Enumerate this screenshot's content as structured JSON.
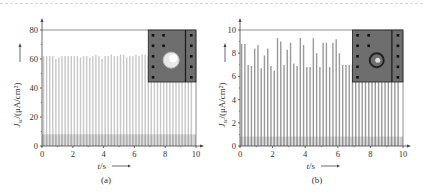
{
  "chart_data": [
    {
      "type": "bar",
      "panel_label": "(a)",
      "title": "",
      "xlabel": "t/s",
      "ylabel": "J_sc/(μA/cm²)",
      "xlim": [
        0,
        10
      ],
      "ylim": [
        0,
        80
      ],
      "xticks": [
        0,
        2,
        4,
        6,
        8,
        10
      ],
      "yticks": [
        0,
        20,
        40,
        60,
        80
      ],
      "grid": false,
      "baseline_level": 8,
      "x": [
        0.1,
        0.3,
        0.5,
        0.7,
        0.9,
        1.1,
        1.3,
        1.5,
        1.7,
        1.9,
        2.1,
        2.3,
        2.5,
        2.7,
        2.9,
        3.1,
        3.3,
        3.5,
        3.7,
        3.9,
        4.1,
        4.3,
        4.5,
        4.7,
        4.9,
        5.1,
        5.3,
        5.5,
        5.7,
        5.9,
        6.1,
        6.3,
        6.5,
        6.7,
        6.9,
        7.1,
        7.3,
        7.5,
        7.7,
        7.9,
        8.1,
        8.3,
        8.5,
        8.7,
        8.9,
        9.1,
        9.3,
        9.5,
        9.7
      ],
      "values": [
        62,
        62,
        62,
        62,
        60,
        61,
        62,
        62,
        62,
        62,
        62,
        62,
        61,
        62,
        62,
        61,
        62,
        63,
        62,
        60,
        62,
        62,
        63,
        62,
        62,
        63,
        63,
        61,
        62,
        62,
        63,
        62,
        63,
        63,
        62,
        62,
        62,
        62,
        62,
        62,
        62,
        62,
        62,
        62,
        62,
        62,
        62,
        62,
        62
      ],
      "inset": {
        "description": "photo",
        "spot": "bright-circle"
      }
    },
    {
      "type": "bar",
      "panel_label": "(b)",
      "title": "",
      "xlabel": "t/s",
      "ylabel": "J_sc/(μA/cm²)",
      "xlim": [
        0,
        10
      ],
      "ylim": [
        0,
        10
      ],
      "xticks": [
        0,
        2,
        4,
        6,
        8,
        10
      ],
      "yticks": [
        0,
        2,
        4,
        6,
        8,
        10
      ],
      "grid": false,
      "baseline_level": 0.8,
      "x": [
        0.1,
        0.3,
        0.5,
        0.7,
        0.9,
        1.1,
        1.3,
        1.5,
        1.7,
        1.9,
        2.1,
        2.3,
        2.5,
        2.7,
        2.9,
        3.1,
        3.3,
        3.5,
        3.7,
        3.9,
        4.1,
        4.3,
        4.5,
        4.7,
        4.9,
        5.1,
        5.3,
        5.5,
        5.7,
        5.9,
        6.1,
        6.3,
        6.5,
        6.7,
        6.9,
        7.1,
        7.3,
        7.5,
        7.7,
        7.9,
        8.1,
        8.3,
        8.5,
        8.7,
        8.9,
        9.1,
        9.3,
        9.5,
        9.7
      ],
      "values": [
        8.8,
        8.8,
        7.0,
        6.9,
        8.4,
        8.7,
        6.7,
        7.8,
        8.4,
        6.9,
        6.5,
        9.3,
        9.0,
        7.0,
        8.3,
        8.9,
        7.1,
        6.9,
        9.3,
        8.7,
        6.8,
        6.8,
        9.3,
        8.0,
        6.8,
        8.9,
        8.9,
        6.8,
        8.9,
        9.2,
        8.0,
        7.0,
        7.0,
        7.0,
        7.0,
        7.0,
        7.0,
        7.0,
        7.0,
        7.0,
        7.0,
        7.0,
        7.0,
        7.0,
        7.0,
        7.0,
        7.0,
        7.0,
        7.0
      ],
      "inset": {
        "description": "photo",
        "spot": "dark-ring"
      }
    }
  ],
  "labels": {
    "a": {
      "ylabel_main": "J",
      "ylabel_sub": "sc",
      "ylabel_rest": "/(μA/cm²)",
      "xlabel_var": "t",
      "xlabel_unit": "/s",
      "panel": "(a)"
    },
    "b": {
      "ylabel_main": "J",
      "ylabel_sub": "sc",
      "ylabel_rest": "/(μA/cm²)",
      "xlabel_var": "t",
      "xlabel_unit": "/s",
      "panel": "(b)"
    }
  },
  "colors": {
    "bar_a": "#c8c8c8",
    "bar_b": "#9a9a9a",
    "baseline_band": "#8c8c8c",
    "axis": "#444444",
    "inset_bg": "#6e6e6e"
  }
}
